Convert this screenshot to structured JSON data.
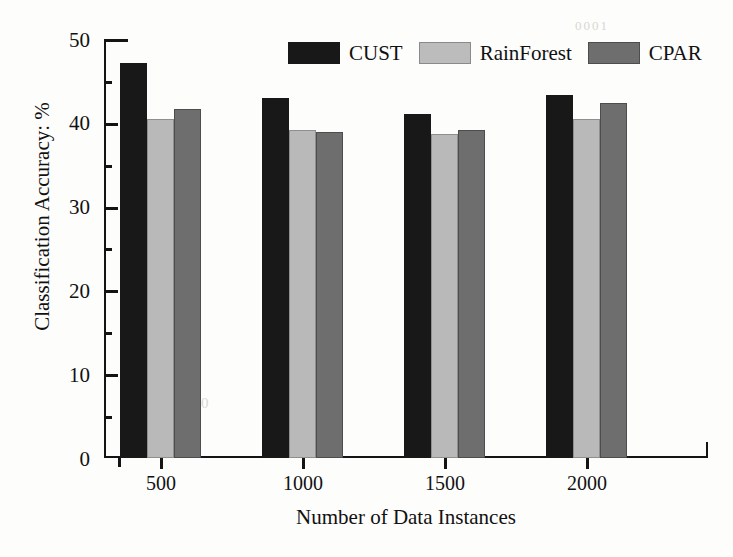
{
  "chart_data": {
    "type": "bar",
    "title": "",
    "xlabel": "Number of Data Instances",
    "ylabel": "Classification Accuracy: %",
    "categories": [
      "500",
      "1000",
      "1500",
      "2000"
    ],
    "series": [
      {
        "name": "CUST",
        "color": "#181818",
        "values": [
          47.2,
          43.0,
          41.0,
          43.3
        ]
      },
      {
        "name": "RainForest",
        "color": "#b9b9b9",
        "values": [
          40.4,
          39.2,
          38.7,
          40.5
        ]
      },
      {
        "name": "CPAR",
        "color": "#6e6e6e",
        "values": [
          41.6,
          38.9,
          39.2,
          42.4
        ]
      }
    ],
    "ylim": [
      0,
      50
    ],
    "yticks": [
      0,
      10,
      20,
      30,
      40,
      50
    ],
    "yticks_minor": [
      5,
      15,
      25,
      35,
      45
    ],
    "grid": false,
    "legend_position": "top-center"
  },
  "axes": {
    "y_title": "Classification Accuracy: %",
    "x_title": "Number of Data Instances",
    "y_tick_labels": [
      "50",
      "40",
      "30",
      "20",
      "10",
      "0"
    ],
    "x_tick_labels": [
      "500",
      "1000",
      "1500",
      "2000"
    ]
  },
  "legend": {
    "items": [
      {
        "label": "CUST",
        "swatch": "cust"
      },
      {
        "label": "RainForest",
        "swatch": "rainforest"
      },
      {
        "label": "CPAR",
        "swatch": "cpar"
      }
    ]
  },
  "artifacts": {
    "a1": "0001",
    "a2": "000"
  }
}
